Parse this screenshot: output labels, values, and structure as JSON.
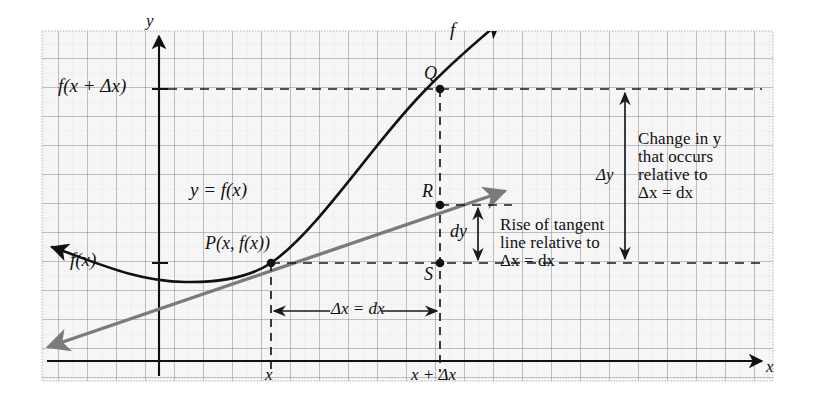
{
  "figure": {
    "background_color": "#f6f6f6",
    "page_color": "#ffffff",
    "grid": {
      "major_line_color": "#8e8e93",
      "minor_line_color": "#c9c9cd",
      "cell_px": 29,
      "frame": {
        "left": 42,
        "top": 31,
        "right": 773,
        "bottom": 381
      }
    },
    "curve_color": "#111111",
    "tangent_color": "#7b7b7b",
    "dash_color": "#1a1a1a"
  },
  "axes": {
    "x_axis_label": "x",
    "y_axis_label": "y",
    "x_axis_y_px": 361,
    "y_axis_x_px": 159
  },
  "points": [
    {
      "name": "P",
      "label": "P(x, f(x))",
      "x_px": 271,
      "y_px": 263
    },
    {
      "name": "Q",
      "label": "Q",
      "x_px": 440,
      "y_px": 89
    },
    {
      "name": "R",
      "label": "R",
      "x_px": 440,
      "y_px": 205
    },
    {
      "name": "S",
      "label": "S",
      "x_px": 440,
      "y_px": 263
    }
  ],
  "labels": {
    "curve_name": "f",
    "curve_equation": "y = f(x)",
    "f_of_x": "f(x)",
    "f_of_x_plus_dx": "f(x + Δx)",
    "x_tick": "x",
    "x_plus_dx_tick": "x + Δx",
    "delta_x_bracket": "Δx = dx",
    "dy_label": "dy",
    "delta_y_label": "Δy"
  },
  "annotations": {
    "tangent_note": {
      "lines": [
        "Rise of tangent",
        "line relative to",
        "Δx = dx"
      ]
    },
    "change_in_y_note": {
      "lines": [
        "Change in y",
        "that occurs",
        "relative to",
        "Δx = dx"
      ]
    }
  }
}
